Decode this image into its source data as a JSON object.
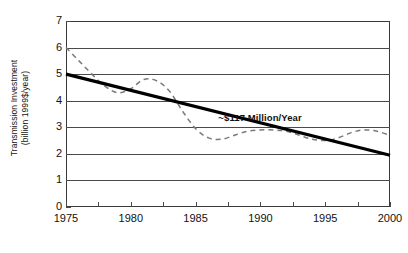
{
  "chart_data": {
    "type": "line",
    "title": "",
    "xlabel": "",
    "ylabel_line1": "Transmission Investment",
    "ylabel_line2": "(billion 1999$/year)",
    "xlim": [
      1975,
      2000
    ],
    "ylim": [
      0,
      7
    ],
    "ytick_labels": [
      "0",
      "1",
      "2",
      "3",
      "4",
      "5",
      "6",
      "7"
    ],
    "ytick_values": [
      0,
      1,
      2,
      3,
      4,
      5,
      6,
      7
    ],
    "xtick_labels": [
      "1975",
      "1980",
      "1985",
      "1990",
      "1995",
      "2000"
    ],
    "xtick_values": [
      1975,
      1980,
      1985,
      1990,
      1995,
      2000
    ],
    "xminor_step": 2.5,
    "grid": "horizontal",
    "legend": "none",
    "annotations": [
      {
        "text": "~$117 Million/Year",
        "x": 1991.0,
        "y": 3.35
      }
    ],
    "series": [
      {
        "name": "Actual transmission investment",
        "style": "dashed",
        "color": "#7a7a7a",
        "x": [
          1975,
          1976,
          1977,
          1978,
          1979,
          1980,
          1981,
          1982,
          1983,
          1984,
          1985,
          1986,
          1987,
          1988,
          1989,
          1990,
          1991,
          1992,
          1993,
          1994,
          1995,
          1996,
          1997,
          1998,
          1999,
          2000
        ],
        "values": [
          6.0,
          5.5,
          5.0,
          4.55,
          4.3,
          4.45,
          4.8,
          4.75,
          4.35,
          3.6,
          2.95,
          2.6,
          2.55,
          2.7,
          2.85,
          2.9,
          2.9,
          2.85,
          2.7,
          2.55,
          2.5,
          2.6,
          2.8,
          2.9,
          2.85,
          2.7
        ]
      },
      {
        "name": "Linear trend",
        "style": "solid",
        "color": "#000000",
        "x": [
          1975,
          2000
        ],
        "values": [
          5.0,
          1.95
        ]
      }
    ]
  }
}
